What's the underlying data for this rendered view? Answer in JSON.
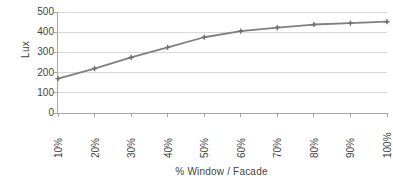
{
  "chart_data": {
    "type": "line",
    "title": "",
    "xlabel": "% Window / Facade",
    "ylabel": "Lux",
    "categories": [
      "10%",
      "20%",
      "30%",
      "40%",
      "50%",
      "60%",
      "70%",
      "80%",
      "90%",
      "100%"
    ],
    "series": [
      {
        "name": "Lux",
        "values": [
          170,
          220,
          275,
          325,
          375,
          405,
          423,
          438,
          445,
          452
        ]
      }
    ],
    "ylim": [
      0,
      500
    ],
    "y_ticks": [
      0,
      100,
      200,
      300,
      400,
      500
    ],
    "y_tick_labels": [
      "0",
      "100",
      "200",
      "300",
      "400",
      "500"
    ],
    "grid": true,
    "grid_axis": "y",
    "legend": false,
    "legend_position": "none",
    "marker": "cross",
    "colors": {
      "line": "#7f7f7f",
      "marker": "#6e6e6e",
      "gridline": "#d9d9d9",
      "axis": "#a6a6a6",
      "text": "#3f3f3f",
      "background": "#ffffff"
    }
  }
}
